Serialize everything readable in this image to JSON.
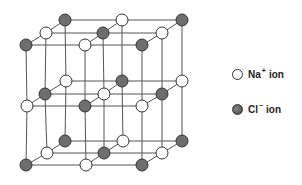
{
  "diagram": {
    "colors": {
      "na_fill": "#ffffff",
      "cl_fill": "#6e6e6e",
      "stroke": "#333333",
      "bond": "#555555"
    },
    "layers": [
      {
        "name": "top",
        "rows": [
          {
            "y": 20,
            "atoms": [
              {
                "x": 65,
                "ion": "Cl"
              },
              {
                "x": 122,
                "ion": "Na"
              },
              {
                "x": 182,
                "ion": "Cl"
              }
            ]
          },
          {
            "y": 33,
            "atoms": [
              {
                "x": 46,
                "ion": "Na"
              },
              {
                "x": 103,
                "ion": "Cl"
              },
              {
                "x": 162,
                "ion": "Na"
              }
            ]
          },
          {
            "y": 45,
            "atoms": [
              {
                "x": 26,
                "ion": "Cl"
              },
              {
                "x": 85,
                "ion": "Na"
              },
              {
                "x": 142,
                "ion": "Cl"
              }
            ]
          }
        ]
      },
      {
        "name": "middle",
        "rows": [
          {
            "y": 81,
            "atoms": [
              {
                "x": 66,
                "ion": "Na"
              },
              {
                "x": 122,
                "ion": "Cl"
              },
              {
                "x": 182,
                "ion": "Na"
              }
            ]
          },
          {
            "y": 94,
            "atoms": [
              {
                "x": 45,
                "ion": "Cl"
              },
              {
                "x": 104,
                "ion": "Na"
              },
              {
                "x": 162,
                "ion": "Cl"
              }
            ]
          },
          {
            "y": 106,
            "atoms": [
              {
                "x": 27,
                "ion": "Na"
              },
              {
                "x": 85,
                "ion": "Cl"
              },
              {
                "x": 142,
                "ion": "Na"
              }
            ]
          }
        ]
      },
      {
        "name": "bottom",
        "rows": [
          {
            "y": 141,
            "atoms": [
              {
                "x": 65,
                "ion": "Cl"
              },
              {
                "x": 123,
                "ion": "Na"
              },
              {
                "x": 182,
                "ion": "Cl"
              }
            ]
          },
          {
            "y": 153,
            "atoms": [
              {
                "x": 47,
                "ion": "Na"
              },
              {
                "x": 104,
                "ion": "Cl"
              },
              {
                "x": 162,
                "ion": "Na"
              }
            ]
          },
          {
            "y": 165,
            "atoms": [
              {
                "x": 26,
                "ion": "Cl"
              },
              {
                "x": 86,
                "ion": "Na"
              },
              {
                "x": 142,
                "ion": "Cl"
              }
            ]
          }
        ]
      }
    ]
  },
  "legend": {
    "na": {
      "symbol": "Na",
      "charge": "+",
      "suffix": "ion"
    },
    "cl": {
      "symbol": "Cl",
      "charge": "−",
      "suffix": "ion"
    }
  }
}
